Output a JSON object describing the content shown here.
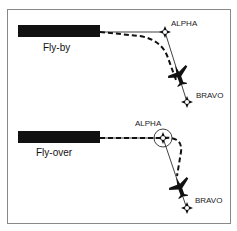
{
  "diagram": {
    "type": "waypoint-turn-comparison",
    "panels": [
      {
        "id": "fly-by",
        "title": "Fly-by",
        "waypoints": [
          {
            "name": "ALPHA",
            "symbol": "fly-by-waypoint"
          },
          {
            "name": "BRAVO",
            "symbol": "fly-by-waypoint"
          }
        ]
      },
      {
        "id": "fly-over",
        "title": "Fly-over",
        "waypoints": [
          {
            "name": "ALPHA",
            "symbol": "fly-over-waypoint"
          },
          {
            "name": "BRAVO",
            "symbol": "fly-by-waypoint"
          }
        ]
      }
    ],
    "colors": {
      "ink": "#111111",
      "frame": "#888888",
      "background": "#ffffff"
    }
  }
}
